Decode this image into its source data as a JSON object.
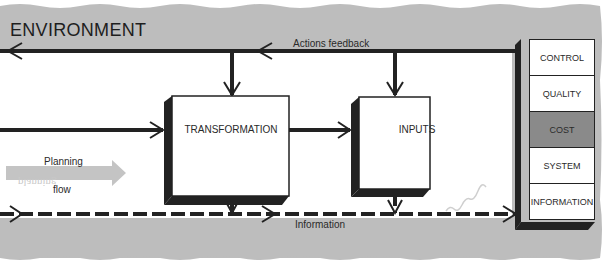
{
  "diagram": {
    "environment_title": "ENVIRONMENT",
    "actions_feedback_label": "Actions feedback",
    "information_label": "Information",
    "planning_label": "Planning",
    "flow_label": "flow",
    "ghost_planning_text": "planning",
    "boxes": {
      "transformation": "TRANSFORMATION",
      "inputs": "INPUTS"
    },
    "stack": [
      {
        "label": "CONTROL",
        "fill": "#ffffff"
      },
      {
        "label": "QUALITY",
        "fill": "#ffffff"
      },
      {
        "label": "COST",
        "fill": "#8a8a8a"
      },
      {
        "label": "SYSTEM",
        "fill": "#ffffff"
      },
      {
        "label": "INFORMATION",
        "fill": "#ffffff"
      }
    ],
    "colors": {
      "environment": "#bdbdbd",
      "line": "#222222",
      "planning_arrow": "#c4c4c4",
      "cost_fill": "#8a8a8a"
    }
  }
}
